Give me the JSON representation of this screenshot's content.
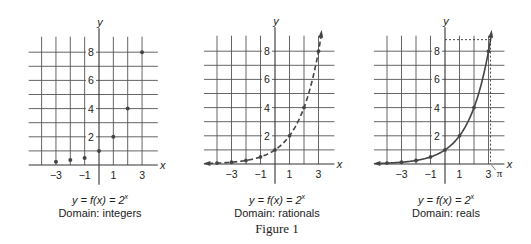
{
  "figure": {
    "title": "Figure 1",
    "panels": [
      {
        "id": "integers",
        "equation": {
          "lhs": "y = f(x) = 2",
          "exponent": "x"
        },
        "domain_label": "Domain: integers",
        "style": "points",
        "origin_px": [
          99,
          165
        ],
        "unit_px": [
          14.35,
          14.1
        ],
        "caption_left": 20
      },
      {
        "id": "rationals",
        "equation": {
          "lhs": "y = f(x) = 2",
          "exponent": "x"
        },
        "domain_label": "Domain: rationals",
        "style": "dashed-curve",
        "origin_px": [
          275,
          164
        ],
        "unit_px": [
          14.5,
          14.1
        ],
        "caption_left": 197
      },
      {
        "id": "reals",
        "equation": {
          "lhs": "y = f(x) = 2",
          "exponent": "x"
        },
        "domain_label": "Domain: reals",
        "style": "solid-curve",
        "origin_px": [
          445,
          164
        ],
        "unit_px": [
          14.5,
          14.1
        ],
        "caption_left": 366,
        "pi_marker": {
          "label": "π",
          "x": 3.14159,
          "y": 8.82
        }
      }
    ],
    "axes": {
      "x_label": "x",
      "y_label": "y",
      "x_ticks": [
        {
          "value": -3,
          "label": "−3"
        },
        {
          "value": -1,
          "label": "−1"
        },
        {
          "value": 1,
          "label": "1"
        },
        {
          "value": 3,
          "label": "3"
        }
      ],
      "y_ticks": [
        {
          "value": 2,
          "label": "2"
        },
        {
          "value": 4,
          "label": "4"
        },
        {
          "value": 6,
          "label": "6"
        },
        {
          "value": 8,
          "label": "8"
        }
      ],
      "grid_x": [
        -4,
        -3,
        -2,
        -1,
        1,
        2,
        3
      ],
      "grid_y": [
        1,
        2,
        3,
        4,
        5,
        6,
        7,
        8
      ],
      "x_range": [
        -4.9,
        4.1
      ],
      "y_range": [
        -1.4,
        9.7
      ]
    },
    "colors": {
      "grid": "#555555",
      "curve": "#444444",
      "text": "#222222"
    }
  },
  "chart_data": [
    {
      "type": "scatter",
      "title": "y = f(x) = 2^x, Domain: integers",
      "xlabel": "x",
      "ylabel": "y",
      "x": [
        -3,
        -2,
        -1,
        0,
        1,
        2,
        3
      ],
      "y": [
        0.125,
        0.25,
        0.5,
        1,
        2,
        4,
        8
      ],
      "xlim": [
        -4,
        3
      ],
      "ylim": [
        0,
        8
      ],
      "grid": true
    },
    {
      "type": "line",
      "title": "y = f(x) = 2^x, Domain: rationals",
      "line_style": "dashed",
      "xlabel": "x",
      "ylabel": "y",
      "x": [
        -4,
        -3,
        -2,
        -1,
        0,
        1,
        2,
        3
      ],
      "y": [
        0.0625,
        0.125,
        0.25,
        0.5,
        1,
        2,
        4,
        8
      ],
      "xlim": [
        -4,
        3
      ],
      "ylim": [
        0,
        8
      ],
      "grid": true
    },
    {
      "type": "line",
      "title": "y = f(x) = 2^x, Domain: reals",
      "line_style": "solid",
      "xlabel": "x",
      "ylabel": "y",
      "x": [
        -4,
        -3,
        -2,
        -1,
        0,
        1,
        2,
        3
      ],
      "y": [
        0.0625,
        0.125,
        0.25,
        0.5,
        1,
        2,
        4,
        8
      ],
      "annotations": [
        {
          "label": "π",
          "x": 3.14159,
          "y": 8.82,
          "style": "dashed guide lines"
        }
      ],
      "xlim": [
        -4,
        3
      ],
      "ylim": [
        0,
        8
      ],
      "grid": true
    }
  ]
}
